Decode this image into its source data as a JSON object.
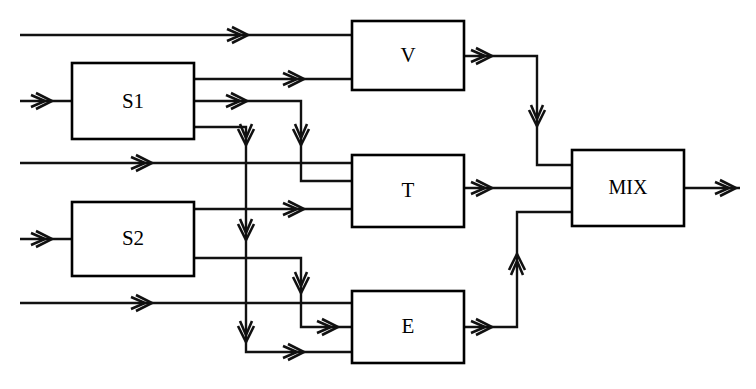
{
  "diagram": {
    "type": "block-flow",
    "canvas": {
      "width": 756,
      "height": 389
    },
    "line_color": "#111111",
    "box_fill": "#ffffff",
    "box_stroke": "#000000",
    "blocks": [
      {
        "id": "S1",
        "label": "S1",
        "x": 72,
        "y": 63,
        "w": 122,
        "h": 76,
        "inputs": 1,
        "outputs": 3
      },
      {
        "id": "S2",
        "label": "S2",
        "x": 72,
        "y": 202,
        "w": 122,
        "h": 74,
        "inputs": 1,
        "outputs": 2
      },
      {
        "id": "V",
        "label": "V",
        "x": 352,
        "y": 21,
        "w": 112,
        "h": 69,
        "inputs": 2,
        "outputs": 1
      },
      {
        "id": "T",
        "label": "T",
        "x": 352,
        "y": 155,
        "w": 112,
        "h": 72,
        "inputs": 2,
        "outputs": 1
      },
      {
        "id": "E",
        "label": "E",
        "x": 352,
        "y": 291,
        "w": 112,
        "h": 72,
        "inputs": 3,
        "outputs": 1
      },
      {
        "id": "MIX",
        "label": "MIX",
        "x": 572,
        "y": 150,
        "w": 112,
        "h": 76,
        "inputs": 3,
        "outputs": 1
      }
    ],
    "feed_lines": [
      {
        "id": "feed-top",
        "label": "",
        "y": 35,
        "from_x": 20,
        "to_x": 352
      },
      {
        "id": "feed-middle",
        "label": "",
        "y": 163,
        "from_x": 20,
        "to_x": 352
      },
      {
        "id": "feed-bottom",
        "label": "",
        "y": 303,
        "from_x": 20,
        "to_x": 352
      }
    ],
    "source_feeds": [
      {
        "id": "feed-s1",
        "target": "S1",
        "y": 101,
        "from_x": 20,
        "to_x": 72
      },
      {
        "id": "feed-s2",
        "target": "S2",
        "y": 239,
        "from_x": 20,
        "to_x": 72
      }
    ],
    "connections": [
      {
        "id": "s1-out1-to-v",
        "from": "S1",
        "to": "V",
        "note": "S1 top output runs right into V lower input"
      },
      {
        "id": "s1-out2-to-t",
        "from": "S1",
        "to": "T",
        "note": "S1 middle output turns down then right into T upper input"
      },
      {
        "id": "s1-out3-to-e",
        "from": "S1",
        "to": "E",
        "note": "S1 bottom output drops the full height then right into E bottom input"
      },
      {
        "id": "s2-out1-to-t",
        "from": "S2",
        "to": "T",
        "note": "S2 top output runs right into T lower input"
      },
      {
        "id": "s2-out2-to-e",
        "from": "S2",
        "to": "E",
        "note": "S2 bottom output turns down then right into E middle input"
      },
      {
        "id": "v-to-mix",
        "from": "V",
        "to": "MIX",
        "note": "V output right, down, right into MIX top input"
      },
      {
        "id": "t-to-mix",
        "from": "T",
        "to": "MIX",
        "note": "T output straight right into MIX middle input"
      },
      {
        "id": "e-to-mix",
        "from": "E",
        "to": "MIX",
        "note": "E output right, up, right into MIX bottom input"
      }
    ],
    "product_outlet": {
      "id": "mix-product-out",
      "from": "MIX",
      "y": 188,
      "from_x": 684,
      "to_x": 740
    }
  }
}
